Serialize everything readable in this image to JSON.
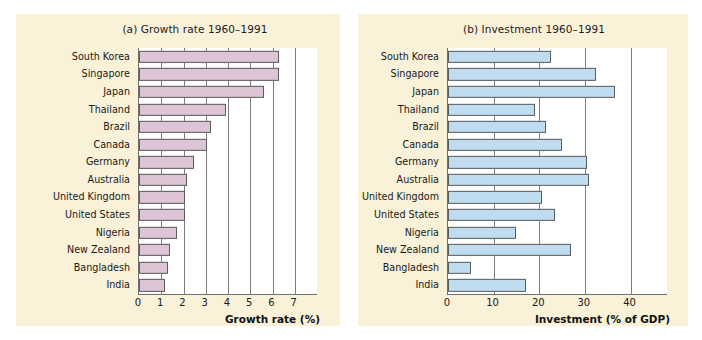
{
  "figure": {
    "background_color": "#f9f1d8",
    "plot_background_color": "#ffffff",
    "page_background_color": "#ffffff"
  },
  "chart_data": [
    {
      "type": "bar",
      "orientation": "horizontal",
      "panel": "a",
      "title": "(a) Growth rate 1960–1991",
      "xlabel": "Growth rate (%)",
      "ylabel": "",
      "xlim": [
        0,
        8
      ],
      "xticks": [
        0,
        1,
        2,
        3,
        4,
        5,
        6,
        7
      ],
      "xticklabels": [
        "0",
        "1",
        "2",
        "3",
        "4",
        "5",
        "6",
        "7"
      ],
      "gridlines": [
        1,
        2,
        3,
        4,
        5,
        6,
        7
      ],
      "grid": true,
      "legend": "none",
      "bar_color": "#ddc4d6",
      "bar_edge_color": "#5d5d5d",
      "categories": [
        "South Korea",
        "Singapore",
        "Japan",
        "Thailand",
        "Brazil",
        "Canada",
        "Germany",
        "Australia",
        "United Kingdom",
        "United States",
        "Nigeria",
        "New Zealand",
        "Bangladesh",
        "India"
      ],
      "values": [
        6.3,
        6.3,
        5.6,
        3.9,
        3.25,
        3.05,
        2.45,
        2.15,
        2.05,
        2.05,
        1.7,
        1.4,
        1.3,
        1.15
      ]
    },
    {
      "type": "bar",
      "orientation": "horizontal",
      "panel": "b",
      "title": "(b) Investment 1960–1991",
      "xlabel": "Investment (% of GDP)",
      "ylabel": "",
      "xlim": [
        0,
        48
      ],
      "xticks": [
        0,
        10,
        20,
        30,
        40
      ],
      "xticklabels": [
        "0",
        "10",
        "20",
        "30",
        "40"
      ],
      "gridlines": [
        10,
        20,
        30,
        40
      ],
      "grid": true,
      "legend": "none",
      "bar_color": "#bfdcf0",
      "bar_edge_color": "#5d5d5d",
      "categories": [
        "South Korea",
        "Singapore",
        "Japan",
        "Thailand",
        "Brazil",
        "Canada",
        "Germany",
        "Australia",
        "United Kingdom",
        "United States",
        "Nigeria",
        "New Zealand",
        "Bangladesh",
        "India"
      ],
      "values": [
        22.5,
        32.5,
        36.5,
        19,
        21.5,
        25,
        30.5,
        30.8,
        20.5,
        23.5,
        15,
        27,
        5,
        17
      ]
    }
  ]
}
